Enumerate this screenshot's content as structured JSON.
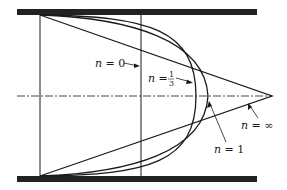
{
  "diagram": {
    "profiles": [
      {
        "id": "n0",
        "label_var": "n",
        "label_eq": "=",
        "label_val": "0",
        "shape": "plug-linear"
      },
      {
        "id": "n13",
        "label_var": "n",
        "label_eq": "=",
        "label_num": "1",
        "label_den": "3",
        "shape": "blunt"
      },
      {
        "id": "n1",
        "label_var": "n",
        "label_eq": "=",
        "label_val": "1",
        "shape": "parabolic"
      },
      {
        "id": "ninf",
        "label_var": "n",
        "label_eq": "=",
        "label_val": "∞",
        "shape": "triangular"
      }
    ],
    "colors": {
      "line": "#1a1a1a",
      "wall": "#222222",
      "background": "#ffffff"
    }
  }
}
